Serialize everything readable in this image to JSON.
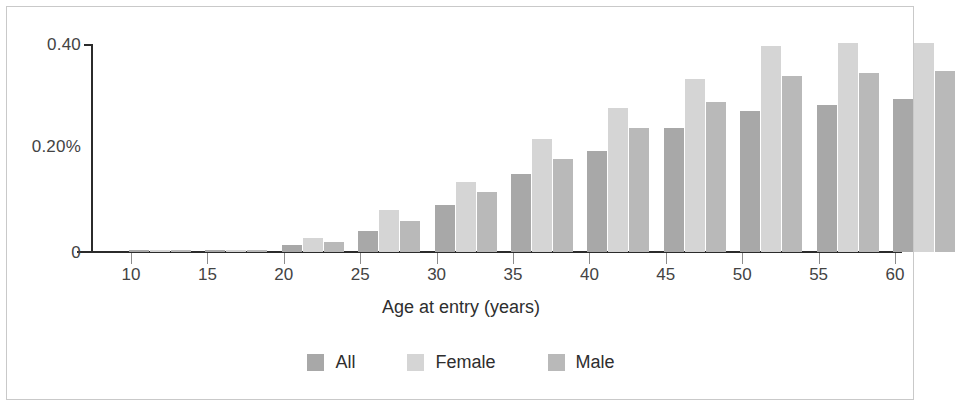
{
  "chart_data": {
    "type": "bar",
    "title": "",
    "xlabel": "Age at entry (years)",
    "ylabel": "",
    "categories": [
      "10",
      "15",
      "20",
      "25",
      "30",
      "35",
      "40",
      "45",
      "50",
      "55",
      "60"
    ],
    "series": [
      {
        "name": "All",
        "color": "#a8a8a8",
        "values": [
          0.003,
          0.004,
          0.014,
          0.039,
          0.088,
          0.146,
          0.19,
          0.232,
          0.265,
          0.277,
          0.287
        ]
      },
      {
        "name": "Female",
        "color": "#d5d5d5",
        "values": [
          0.003,
          0.004,
          0.026,
          0.079,
          0.131,
          0.212,
          0.27,
          0.325,
          0.387,
          0.392,
          0.392
        ]
      },
      {
        "name": "Male",
        "color": "#b9b9b9",
        "values": [
          0.003,
          0.004,
          0.019,
          0.058,
          0.113,
          0.175,
          0.232,
          0.281,
          0.331,
          0.337,
          0.34
        ]
      }
    ],
    "ytick_labels": [
      "0.40",
      "0.20%",
      "0"
    ],
    "ytick_values": [
      0.4,
      0.2,
      0
    ],
    "ylim": [
      0,
      0.4
    ],
    "xtick_labels": [
      "10",
      "15",
      "20",
      "25",
      "30",
      "35",
      "40",
      "45",
      "50",
      "55",
      "60"
    ],
    "grid": false,
    "legend_position": "bottom"
  },
  "axes": {
    "y_label_top": "0.40",
    "y_label_mid": "0.20%",
    "y_label_zero": "0",
    "x_title": "Age at entry (years)"
  },
  "legend": {
    "items": [
      {
        "label": "All",
        "color": "#a8a8a8"
      },
      {
        "label": "Female",
        "color": "#d5d5d5"
      },
      {
        "label": "Male",
        "color": "#b9b9b9"
      }
    ]
  }
}
